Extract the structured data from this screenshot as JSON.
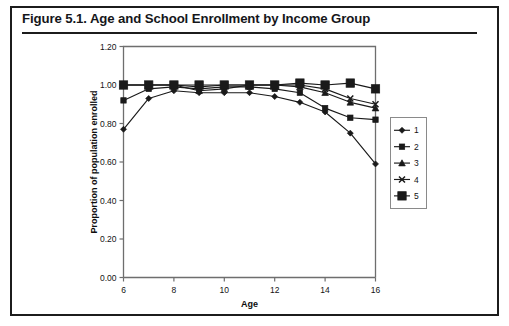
{
  "figure": {
    "title": "Figure 5.1.  Age and School Enrollment by Income Group"
  },
  "chart_data": {
    "type": "line",
    "title": "Age and School Enrollment by Income Group",
    "xlabel": "Age",
    "ylabel": "Proportion of population enrolled",
    "xlim": [
      6,
      16
    ],
    "ylim": [
      0.0,
      1.2
    ],
    "xticks": [
      6,
      8,
      10,
      12,
      14,
      16
    ],
    "xtick_labels": [
      "6",
      "8",
      "10",
      "12",
      "14",
      "16"
    ],
    "yticks": [
      0.0,
      0.2,
      0.4,
      0.6,
      0.8,
      1.0,
      1.2
    ],
    "ytick_labels": [
      "0.00",
      "0.20",
      "0.40",
      "0.60",
      "0.80",
      "1.00",
      "1.20"
    ],
    "grid": false,
    "legend_position": "right",
    "x": [
      6,
      7,
      8,
      9,
      10,
      11,
      12,
      13,
      14,
      15,
      16
    ],
    "series": [
      {
        "name": "1",
        "marker": "diamond",
        "values": [
          0.77,
          0.93,
          0.97,
          0.96,
          0.96,
          0.96,
          0.94,
          0.91,
          0.86,
          0.75,
          0.59
        ]
      },
      {
        "name": "2",
        "marker": "small-square",
        "values": [
          0.92,
          0.98,
          0.99,
          0.98,
          0.99,
          0.99,
          0.98,
          0.96,
          0.88,
          0.83,
          0.82
        ]
      },
      {
        "name": "3",
        "marker": "triangle",
        "values": [
          1.0,
          1.0,
          1.0,
          0.97,
          0.98,
          1.0,
          1.0,
          0.99,
          0.96,
          0.91,
          0.88
        ]
      },
      {
        "name": "4",
        "marker": "cross",
        "values": [
          1.0,
          1.0,
          1.0,
          0.99,
          1.0,
          1.0,
          1.0,
          1.0,
          0.98,
          0.93,
          0.9
        ]
      },
      {
        "name": "5",
        "marker": "large-square",
        "values": [
          1.0,
          1.0,
          1.0,
          1.0,
          1.0,
          1.0,
          1.0,
          1.01,
          1.0,
          1.01,
          0.98
        ]
      }
    ],
    "legend_entries": [
      "1",
      "2",
      "3",
      "4",
      "5"
    ]
  },
  "colors": {
    "line": "#1a1a1a",
    "frame": "#6e6e6e",
    "border": "#1c1c1c",
    "background": "#ffffff"
  }
}
